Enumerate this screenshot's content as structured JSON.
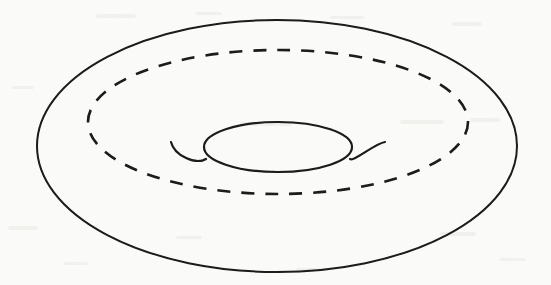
{
  "figure": {
    "kind": "line-drawing",
    "subject": "torus",
    "description": "Hand-drawn torus (donut surface) shown in oblique perspective with a dashed closed curve drawn on the upper surface encircling the central hole",
    "background_color": "#fbfbf9",
    "ink_color": "#1a1a1a",
    "canvas": {
      "width": 551,
      "height": 285
    }
  },
  "chart_data": {
    "type": "line",
    "title": "",
    "subtitle": "",
    "xlabel": "",
    "ylabel": "",
    "grid": false,
    "legend_position": "none",
    "axis_ranges": {
      "x": [
        0,
        551
      ],
      "y": [
        0,
        285
      ]
    },
    "annotations": [],
    "tick_labels": {
      "x": [],
      "y": []
    },
    "series": [
      {
        "name": "outer-silhouette",
        "role": "torus outer boundary ellipse",
        "style": "solid",
        "stroke_width": 2.0,
        "shape": "ellipse",
        "center": [
          277,
          146
        ],
        "rx": 240,
        "ry": 126
      },
      {
        "name": "dashed-cycle",
        "role": "dashed closed curve on top surface (homology cycle)",
        "style": "dashed",
        "stroke_width": 2.6,
        "dash_pattern": [
          13,
          11
        ],
        "shape": "ellipse",
        "center": [
          278,
          122
        ],
        "rx": 190,
        "ry": 72
      },
      {
        "name": "inner-hole",
        "role": "central hole ellipse",
        "style": "solid",
        "stroke_width": 2.2,
        "shape": "ellipse",
        "center": [
          278,
          147
        ],
        "rx": 74,
        "ry": 25
      },
      {
        "name": "left-tube-arc",
        "role": "left inner tube curvature hook",
        "style": "solid",
        "stroke_width": 2.2,
        "shape": "arc",
        "from": [
          171,
          142
        ],
        "to": [
          206,
          159
        ]
      },
      {
        "name": "right-tube-arc",
        "role": "right inner tube curvature hook",
        "style": "solid",
        "stroke_width": 2.2,
        "shape": "arc",
        "from": [
          350,
          159
        ],
        "to": [
          385,
          142
        ]
      }
    ]
  }
}
